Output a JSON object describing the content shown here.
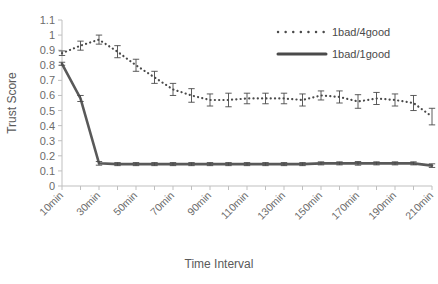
{
  "chart_data": {
    "type": "line",
    "title": "",
    "xlabel": "Time Interval",
    "ylabel": "Trust Score",
    "ylim": [
      0,
      1.1
    ],
    "ytick_values": [
      0,
      0.1,
      0.2,
      0.3,
      0.4,
      0.5,
      0.6,
      0.7,
      0.8,
      0.9,
      1,
      1.1
    ],
    "ytick_labels": [
      "0",
      "0.1",
      "0.2",
      "0.3",
      "0.4",
      "0.5",
      "0.6",
      "0.7",
      "0.8",
      "0.9",
      "1",
      "1.1"
    ],
    "grid": false,
    "legend_position": "top-right",
    "x": [
      "10min",
      "20min",
      "30min",
      "40min",
      "50min",
      "60min",
      "70min",
      "80min",
      "90min",
      "100min",
      "110min",
      "120min",
      "130min",
      "140min",
      "150min",
      "160min",
      "170min",
      "180min",
      "190min",
      "200min",
      "210min"
    ],
    "xtick_labels": [
      "10min",
      "30min",
      "50min",
      "70min",
      "90min",
      "110min",
      "130min",
      "150min",
      "170min",
      "190min",
      "210min"
    ],
    "xtick_label_every": 2,
    "series": [
      {
        "name": "1bad/4good",
        "style": "dotted",
        "color": "#4a4a4a",
        "values": [
          0.88,
          0.93,
          0.97,
          0.89,
          0.8,
          0.72,
          0.64,
          0.6,
          0.57,
          0.57,
          0.58,
          0.58,
          0.58,
          0.57,
          0.6,
          0.59,
          0.56,
          0.58,
          0.57,
          0.55,
          0.46
        ],
        "errors": [
          0.015,
          0.03,
          0.03,
          0.04,
          0.04,
          0.04,
          0.04,
          0.045,
          0.04,
          0.045,
          0.035,
          0.035,
          0.035,
          0.04,
          0.03,
          0.04,
          0.045,
          0.04,
          0.04,
          0.05,
          0.055
        ]
      },
      {
        "name": "1bad/1good",
        "style": "solid",
        "color": "#595959",
        "values": [
          0.81,
          0.58,
          0.15,
          0.145,
          0.145,
          0.145,
          0.145,
          0.145,
          0.145,
          0.145,
          0.145,
          0.145,
          0.145,
          0.145,
          0.15,
          0.15,
          0.15,
          0.15,
          0.15,
          0.15,
          0.135
        ],
        "errors": [
          0.01,
          0.02,
          0.012,
          0.01,
          0.01,
          0.01,
          0.01,
          0.01,
          0.01,
          0.01,
          0.01,
          0.01,
          0.01,
          0.01,
          0.01,
          0.01,
          0.012,
          0.01,
          0.01,
          0.01,
          0.012
        ]
      }
    ]
  },
  "legend": {
    "entries": [
      {
        "label": "1bad/4good",
        "marker": "dotted-line"
      },
      {
        "label": "1bad/1good",
        "marker": "solid-line"
      }
    ]
  },
  "axes": {
    "y_title": "Trust Score",
    "x_title": "Time Interval"
  }
}
